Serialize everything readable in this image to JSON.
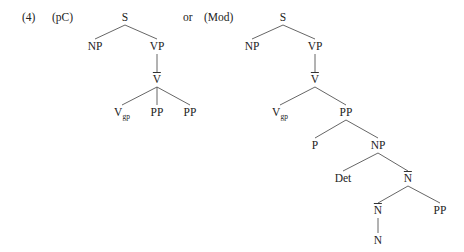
{
  "example_number": "(4)",
  "connector": "or",
  "trees": [
    {
      "label": "(pC)",
      "nodes": [
        {
          "id": "S",
          "text": "S",
          "x": 125,
          "y": 17
        },
        {
          "id": "NP",
          "text": "NP",
          "x": 95,
          "y": 46
        },
        {
          "id": "VP",
          "text": "VP",
          "x": 157,
          "y": 46
        },
        {
          "id": "Vbar",
          "text": "V",
          "bar": true,
          "x": 157,
          "y": 79
        },
        {
          "id": "Vgp",
          "text": "V",
          "sub": "gp",
          "x": 122,
          "y": 112
        },
        {
          "id": "PP1",
          "text": "PP",
          "x": 157,
          "y": 112
        },
        {
          "id": "PP2",
          "text": "PP",
          "x": 190,
          "y": 112
        }
      ],
      "edges": [
        [
          "S",
          "NP"
        ],
        [
          "S",
          "VP"
        ],
        [
          "VP",
          "Vbar"
        ],
        [
          "Vbar",
          "Vgp"
        ],
        [
          "Vbar",
          "PP1"
        ],
        [
          "Vbar",
          "PP2"
        ]
      ]
    },
    {
      "label": "(Mod)",
      "nodes": [
        {
          "id": "S",
          "text": "S",
          "x": 283,
          "y": 17
        },
        {
          "id": "NP",
          "text": "NP",
          "x": 252,
          "y": 46
        },
        {
          "id": "VP",
          "text": "VP",
          "x": 315,
          "y": 46
        },
        {
          "id": "Vbar",
          "text": "V",
          "bar": true,
          "x": 315,
          "y": 79
        },
        {
          "id": "Vgp",
          "text": "V",
          "sub": "gp",
          "x": 280,
          "y": 112
        },
        {
          "id": "PP",
          "text": "PP",
          "x": 346,
          "y": 112
        },
        {
          "id": "P",
          "text": "P",
          "x": 315,
          "y": 145
        },
        {
          "id": "NP2",
          "text": "NP",
          "x": 378,
          "y": 145
        },
        {
          "id": "Det",
          "text": "Det",
          "x": 343,
          "y": 178
        },
        {
          "id": "Nbar1",
          "text": "N",
          "bar": true,
          "x": 408,
          "y": 178
        },
        {
          "id": "Nbar2",
          "text": "N",
          "bar": true,
          "x": 378,
          "y": 210
        },
        {
          "id": "PP3",
          "text": "PP",
          "x": 440,
          "y": 210
        },
        {
          "id": "N",
          "text": "N",
          "x": 378,
          "y": 240
        }
      ],
      "edges": [
        [
          "S",
          "NP"
        ],
        [
          "S",
          "VP"
        ],
        [
          "VP",
          "Vbar"
        ],
        [
          "Vbar",
          "Vgp"
        ],
        [
          "Vbar",
          "PP"
        ],
        [
          "PP",
          "P"
        ],
        [
          "PP",
          "NP2"
        ],
        [
          "NP2",
          "Det"
        ],
        [
          "NP2",
          "Nbar1"
        ],
        [
          "Nbar1",
          "Nbar2"
        ],
        [
          "Nbar1",
          "PP3"
        ],
        [
          "Nbar2",
          "N"
        ]
      ]
    }
  ]
}
